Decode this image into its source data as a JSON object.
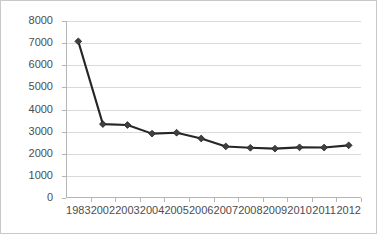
{
  "chart_data": {
    "type": "line",
    "title": "",
    "subtitle": "",
    "xlabel": "",
    "ylabel": "",
    "categories": [
      "1983",
      "2002",
      "2003",
      "2004",
      "2005",
      "2006",
      "2007",
      "2008",
      "2009",
      "2010",
      "2011",
      "2012"
    ],
    "values": [
      7080,
      3340,
      3300,
      2910,
      2950,
      2690,
      2330,
      2270,
      2230,
      2290,
      2280,
      2380
    ],
    "series": [
      {
        "name": "",
        "values": [
          7080,
          3340,
          3300,
          2910,
          2950,
          2690,
          2330,
          2270,
          2230,
          2290,
          2280,
          2380
        ]
      }
    ],
    "ylim": [
      0,
      8000
    ],
    "y_ticks": [
      0,
      1000,
      2000,
      3000,
      4000,
      5000,
      6000,
      7000,
      8000
    ],
    "y_tick_labels": [
      "0",
      "1000",
      "2000",
      "3000",
      "4000",
      "5000",
      "6000",
      "7000",
      "8000"
    ],
    "x_tick_labels": [
      "1983",
      "2002",
      "2003",
      "2004",
      "2005",
      "2006",
      "2007",
      "2008",
      "2009",
      "2010",
      "2011",
      "2012"
    ],
    "grid": "horizontal",
    "legend": "none",
    "annotations": [],
    "colors": {
      "line": "#262626",
      "marker": "#404040",
      "gridline": "#d9d9d9",
      "axis": "#b5b5b5",
      "tick_text": "#4d4d4d",
      "border": "#c9c9c9",
      "background": "#ffffff"
    },
    "marker_shape": "diamond"
  }
}
